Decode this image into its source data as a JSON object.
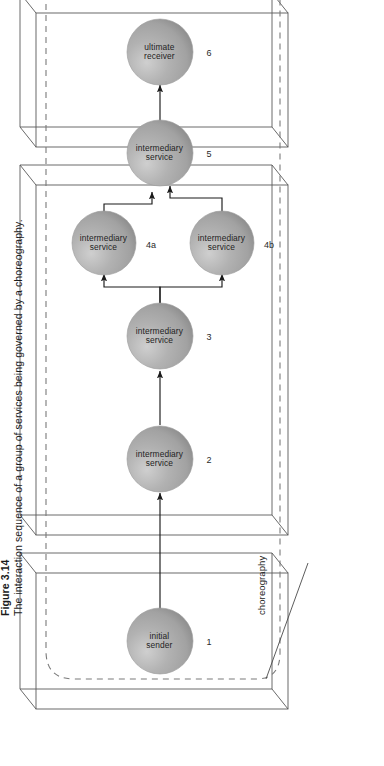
{
  "figure": {
    "number": "Figure 3.14",
    "caption": "The interaction sequence of a group of services being governed by a choreography.",
    "callout_label": "choreography",
    "boundary_style": "dashed-rounded-rectangle",
    "colors": {
      "sphere_fill": "#a9a9a9",
      "sphere_highlight": "#c9c9c9",
      "sphere_shade": "#8e8e8e",
      "box_outline": "#555555",
      "dashed_boundary": "#777777",
      "arrow": "#1a1a1a",
      "text": "#1a1a1a",
      "background": "#ffffff"
    },
    "containers": [
      {
        "id": "container-1",
        "name": "initial-sender-container",
        "nodes": [
          "1"
        ]
      },
      {
        "id": "container-2",
        "name": "intermediary-services-container",
        "nodes": [
          "2",
          "3",
          "4a",
          "4b",
          "5"
        ]
      },
      {
        "id": "container-3",
        "name": "ultimate-receiver-container",
        "nodes": [
          "6"
        ]
      }
    ],
    "nodes": [
      {
        "id": "n1",
        "number": "1",
        "line1": "initial",
        "line2": "sender",
        "container": "container-1"
      },
      {
        "id": "n2",
        "number": "2",
        "line1": "intermediary",
        "line2": "service",
        "container": "container-2"
      },
      {
        "id": "n3",
        "number": "3",
        "line1": "intermediary",
        "line2": "service",
        "container": "container-2"
      },
      {
        "id": "n4a",
        "number": "4a",
        "line1": "intermediary",
        "line2": "service",
        "container": "container-2"
      },
      {
        "id": "n4b",
        "number": "4b",
        "line1": "intermediary",
        "line2": "service",
        "container": "container-2"
      },
      {
        "id": "n5",
        "number": "5",
        "line1": "intermediary",
        "line2": "service",
        "container": "container-2"
      },
      {
        "id": "n6",
        "number": "6",
        "line1": "ultimate",
        "line2": "receiver",
        "container": "container-3"
      }
    ],
    "arrows": [
      {
        "from": "n1",
        "to": "n2",
        "type": "straight"
      },
      {
        "from": "n2",
        "to": "n3",
        "type": "straight"
      },
      {
        "from": "n3",
        "to": "n4a",
        "type": "branch"
      },
      {
        "from": "n3",
        "to": "n4b",
        "type": "branch"
      },
      {
        "from": "n4a",
        "to": "n5",
        "type": "merge"
      },
      {
        "from": "n4b",
        "to": "n5",
        "type": "merge"
      },
      {
        "from": "n5",
        "to": "n6",
        "type": "straight"
      }
    ]
  }
}
